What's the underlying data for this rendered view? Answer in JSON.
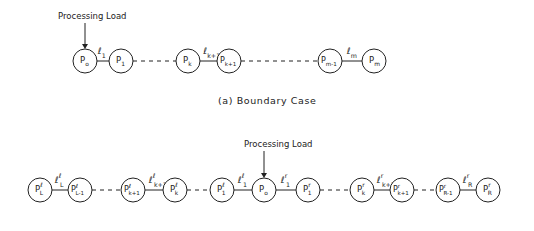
{
  "diagram_a": {
    "title": "Processing Load",
    "caption": "(a) Boundary Case",
    "nodes": [
      {
        "id": "p0",
        "base": "P",
        "sub": "o",
        "sup": "",
        "x": 85,
        "y": 61
      },
      {
        "id": "p1",
        "base": "P",
        "sub": "1",
        "sup": "",
        "x": 121,
        "y": 61
      },
      {
        "id": "pk",
        "base": "P",
        "sub": "k",
        "sup": "",
        "x": 188,
        "y": 61
      },
      {
        "id": "pk1",
        "base": "P",
        "sub": "k+1",
        "sup": "",
        "x": 229,
        "y": 61
      },
      {
        "id": "pm1",
        "base": "P",
        "sub": "m-1",
        "sup": "",
        "x": 330,
        "y": 61
      },
      {
        "id": "pm",
        "base": "P",
        "sub": "m",
        "sup": "",
        "x": 374,
        "y": 61
      }
    ],
    "links": [
      {
        "from": "p0",
        "to": "p1",
        "style": "solid",
        "label_base": "ℓ",
        "label_sub": "1",
        "label_sup": ""
      },
      {
        "from": "p1",
        "to": "pk",
        "style": "dashed",
        "label_base": "",
        "label_sub": "",
        "label_sup": ""
      },
      {
        "from": "pk",
        "to": "pk1",
        "style": "solid",
        "label_base": "ℓ",
        "label_sub": "k+1",
        "label_sup": ""
      },
      {
        "from": "pk1",
        "to": "pm1",
        "style": "dashed",
        "label_base": "",
        "label_sub": "",
        "label_sup": ""
      },
      {
        "from": "pm1",
        "to": "pm",
        "style": "solid",
        "label_base": "ℓ",
        "label_sub": "m",
        "label_sup": ""
      }
    ],
    "load_arrow_target": "p0"
  },
  "diagram_b": {
    "title": "Processing Load",
    "nodes": [
      {
        "id": "pL",
        "base": "P",
        "sub": "L",
        "sup": "ℓ",
        "x": 40,
        "y": 190
      },
      {
        "id": "pL1",
        "base": "P",
        "sub": "L-1",
        "sup": "ℓ",
        "x": 80,
        "y": 190
      },
      {
        "id": "pkl1",
        "base": "P",
        "sub": "k+1",
        "sup": "ℓ",
        "x": 133,
        "y": 190
      },
      {
        "id": "pkl",
        "base": "P",
        "sub": "k",
        "sup": "ℓ",
        "x": 175,
        "y": 190
      },
      {
        "id": "p1l",
        "base": "P",
        "sub": "1",
        "sup": "ℓ",
        "x": 222,
        "y": 190
      },
      {
        "id": "p0",
        "base": "P",
        "sub": "o",
        "sup": "",
        "x": 264,
        "y": 190
      },
      {
        "id": "p1r",
        "base": "P",
        "sub": "1",
        "sup": "r",
        "x": 308,
        "y": 190
      },
      {
        "id": "pkr",
        "base": "P",
        "sub": "k",
        "sup": "r",
        "x": 362,
        "y": 190
      },
      {
        "id": "pkr1",
        "base": "P",
        "sub": "k+1",
        "sup": "r",
        "x": 402,
        "y": 190
      },
      {
        "id": "pR1",
        "base": "P",
        "sub": "R-1",
        "sup": "r",
        "x": 448,
        "y": 190
      },
      {
        "id": "pR",
        "base": "P",
        "sub": "R",
        "sup": "r",
        "x": 488,
        "y": 190
      }
    ],
    "links": [
      {
        "from": "pL",
        "to": "pL1",
        "style": "solid",
        "label_base": "ℓ",
        "label_sub": "L",
        "label_sup": "ℓ"
      },
      {
        "from": "pL1",
        "to": "pkl1",
        "style": "dashed",
        "label_base": "",
        "label_sub": "",
        "label_sup": ""
      },
      {
        "from": "pkl1",
        "to": "pkl",
        "style": "solid",
        "label_base": "ℓ",
        "label_sub": "k+1",
        "label_sup": "ℓ"
      },
      {
        "from": "pkl",
        "to": "p1l",
        "style": "dashed",
        "label_base": "",
        "label_sub": "",
        "label_sup": ""
      },
      {
        "from": "p1l",
        "to": "p0",
        "style": "solid",
        "label_base": "ℓ",
        "label_sub": "1",
        "label_sup": "ℓ"
      },
      {
        "from": "p0",
        "to": "p1r",
        "style": "solid",
        "label_base": "ℓ",
        "label_sub": "1",
        "label_sup": "r"
      },
      {
        "from": "p1r",
        "to": "pkr",
        "style": "dashed",
        "label_base": "",
        "label_sub": "",
        "label_sup": ""
      },
      {
        "from": "pkr",
        "to": "pkr1",
        "style": "solid",
        "label_base": "ℓ",
        "label_sub": "k+1",
        "label_sup": "r"
      },
      {
        "from": "pkr1",
        "to": "pR1",
        "style": "dashed",
        "label_base": "",
        "label_sub": "",
        "label_sup": ""
      },
      {
        "from": "pR1",
        "to": "pR",
        "style": "solid",
        "label_base": "ℓ",
        "label_sub": "R",
        "label_sup": "r"
      }
    ],
    "load_arrow_target": "p0"
  },
  "style": {
    "stroke": "#222222",
    "background": "#ffffff",
    "node_radius": 12
  }
}
